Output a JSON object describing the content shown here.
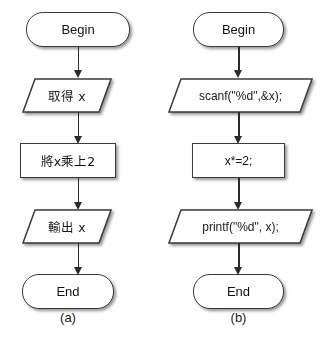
{
  "figure": {
    "background_color": "#ffffff",
    "shape_outline_color": "#3a3a3a",
    "arrow_color": "#2b2b2b",
    "text_color": "#111111"
  },
  "panels": [
    {
      "id": "panel-a",
      "caption": "(a)",
      "nodes": [
        {
          "id": "a-begin",
          "shape": "terminator",
          "label": "Begin"
        },
        {
          "id": "a-input",
          "shape": "parallelogram",
          "label": "取得 x"
        },
        {
          "id": "a-process",
          "shape": "rectangle",
          "label": "將x乘上2"
        },
        {
          "id": "a-output",
          "shape": "parallelogram",
          "label": "輸出 x"
        },
        {
          "id": "a-end",
          "shape": "terminator",
          "label": "End"
        }
      ],
      "connectors": [
        {
          "from": "a-begin",
          "to": "a-input"
        },
        {
          "from": "a-input",
          "to": "a-process"
        },
        {
          "from": "a-process",
          "to": "a-output"
        },
        {
          "from": "a-output",
          "to": "a-end"
        }
      ]
    },
    {
      "id": "panel-b",
      "caption": "(b)",
      "nodes": [
        {
          "id": "b-begin",
          "shape": "terminator",
          "label": "Begin"
        },
        {
          "id": "b-input",
          "shape": "parallelogram",
          "label": "scanf(\"%d\",&x);"
        },
        {
          "id": "b-process",
          "shape": "rectangle",
          "label": "x*=2;"
        },
        {
          "id": "b-output",
          "shape": "parallelogram",
          "label": "printf(\"%d\", x);"
        },
        {
          "id": "b-end",
          "shape": "terminator",
          "label": "End"
        }
      ],
      "connectors": [
        {
          "from": "b-begin",
          "to": "b-input"
        },
        {
          "from": "b-input",
          "to": "b-process"
        },
        {
          "from": "b-process",
          "to": "b-output"
        },
        {
          "from": "b-output",
          "to": "b-end"
        }
      ]
    }
  ]
}
